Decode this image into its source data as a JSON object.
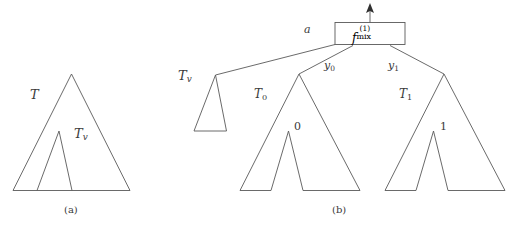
{
  "figure": {
    "background_color": "#ffffff",
    "line_color": "#595959",
    "text_color": "#3a3a3a",
    "panels": [
      {
        "id": "panel-a",
        "caption": "(a)",
        "labels": [
          {
            "name": "tree-label-T",
            "text": "T"
          },
          {
            "name": "subtree-label-Tv",
            "base": "T",
            "sub": "v"
          }
        ]
      },
      {
        "id": "panel-b",
        "caption": "(b)",
        "labels": [
          {
            "name": "subtree-label-Tv",
            "base": "T",
            "sub": "v"
          },
          {
            "name": "edge-label-a",
            "text": "a"
          },
          {
            "name": "edge-label-y0",
            "base": "y",
            "sub": "0"
          },
          {
            "name": "edge-label-y1",
            "base": "y",
            "sub": "1"
          },
          {
            "name": "subtree-label-T0",
            "base": "T",
            "sub": "0"
          },
          {
            "name": "subtree-label-T1",
            "base": "T",
            "sub": "1"
          },
          {
            "name": "leaf-label-0",
            "text": "0"
          },
          {
            "name": "leaf-label-1",
            "text": "1"
          }
        ],
        "gate_box": {
          "name": "fmix-gate-box",
          "function_base": "f",
          "superscript": "(1)",
          "subscript": "mix",
          "full_text": "f^(1)_mix"
        }
      }
    ]
  },
  "panel_a": {
    "label_T": "T",
    "label_Tv_base": "T",
    "label_Tv_sub": "v",
    "caption": "(a)"
  },
  "panel_b": {
    "label_Tv_base": "T",
    "label_Tv_sub": "v",
    "label_a": "a",
    "label_y0_base": "y",
    "label_y0_sub": "0",
    "label_y1_base": "y",
    "label_y1_sub": "1",
    "label_T0_base": "T",
    "label_T0_sub": "0",
    "label_T1_base": "T",
    "label_T1_sub": "1",
    "label_leaf0": "0",
    "label_leaf1": "1",
    "gate_f": "f",
    "gate_sup": "(1)",
    "gate_sub": "mix",
    "caption": "(b)"
  }
}
